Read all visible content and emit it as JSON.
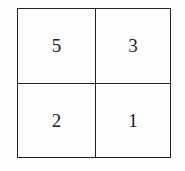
{
  "grid": {
    "rows": 2,
    "cols": 2,
    "cells": [
      "5",
      "3",
      "2",
      "1"
    ]
  }
}
